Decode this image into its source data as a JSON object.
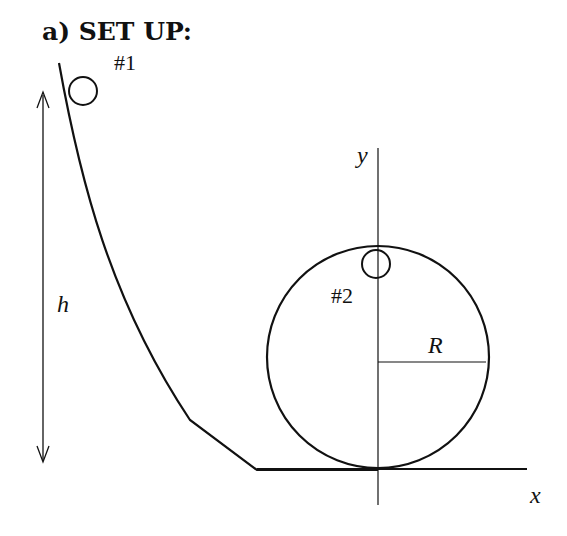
{
  "title": "a) SET UP:",
  "labels": {
    "ball1": "#1",
    "ball2": "#2",
    "height": "h",
    "radius": "R",
    "x_axis": "x",
    "y_axis": "y"
  },
  "colors": {
    "line": "#111111",
    "background": "#ffffff"
  }
}
